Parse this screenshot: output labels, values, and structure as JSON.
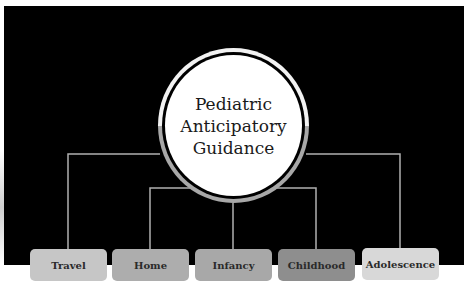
{
  "diagram": {
    "title_lines": [
      "Pediatric",
      "Anticipatory",
      "Guidance"
    ],
    "branches": [
      {
        "label": "Travel",
        "color": "#c6c6c6"
      },
      {
        "label": "Home",
        "color": "#adadad"
      },
      {
        "label": "Infancy",
        "color": "#a8a8a8"
      },
      {
        "label": "Childhood",
        "color": "#8e8e8e"
      },
      {
        "label": "Adolescence",
        "color": "#d8d8d8"
      }
    ],
    "colors": {
      "background": "#000000",
      "connector": "#b0b0b0",
      "hub_ring_top": "#f2f2f2",
      "hub_ring_bottom": "#a8a8a8",
      "hub_fill": "#ffffff"
    }
  }
}
